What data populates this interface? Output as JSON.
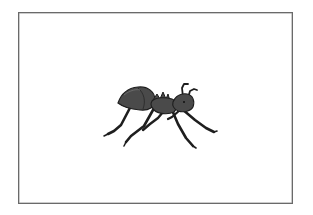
{
  "illustration": {
    "subject": "ant",
    "icon": "ant-icon",
    "colors": {
      "body": "#4a4a4a",
      "body_highlight": "#5c5c5c",
      "outline": "#1e1e1e",
      "frame_border": "#6a6a6a",
      "background": "#ffffff"
    }
  }
}
